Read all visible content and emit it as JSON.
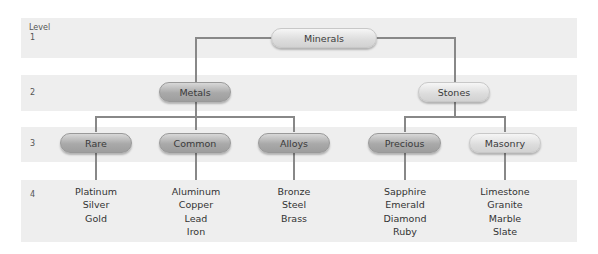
{
  "diagram": {
    "level_header": "Level",
    "levels": [
      "1",
      "2",
      "3",
      "4"
    ],
    "root": {
      "label": "Minerals"
    },
    "level2": [
      {
        "label": "Metals"
      },
      {
        "label": "Stones"
      }
    ],
    "level3": [
      {
        "label": "Rare"
      },
      {
        "label": "Common"
      },
      {
        "label": "Alloys"
      },
      {
        "label": "Precious"
      },
      {
        "label": "Masonry"
      }
    ],
    "level4": [
      {
        "items": [
          "Platinum",
          "Silver",
          "Gold"
        ]
      },
      {
        "items": [
          "Aluminum",
          "Copper",
          "Lead",
          "Iron"
        ]
      },
      {
        "items": [
          "Bronze",
          "Steel",
          "Brass"
        ]
      },
      {
        "items": [
          "Sapphire",
          "Emerald",
          "Diamond",
          "Ruby"
        ]
      },
      {
        "items": [
          "Limestone",
          "Granite",
          "Marble",
          "Slate"
        ]
      }
    ],
    "colors": {
      "band": "#eeeeee",
      "line": "#888888",
      "dark_pill": "#a9a9a9",
      "light_pill": "#dcdcdc"
    }
  }
}
